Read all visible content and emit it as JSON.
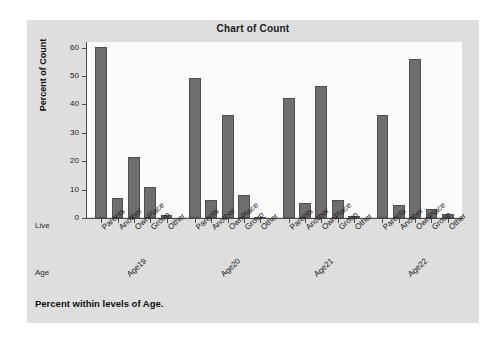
{
  "chart_data": {
    "type": "bar",
    "title": "Chart of Count",
    "xlabel": "",
    "ylabel": "Percent of Count",
    "ylim": [
      0,
      62
    ],
    "yticks": [
      0,
      10,
      20,
      30,
      40,
      50,
      60
    ],
    "grid": false,
    "legend": null,
    "footnote": "Percent within levels of Age.",
    "row_labels": {
      "categories": "Live",
      "groups": "Age"
    },
    "categories": [
      "Parents",
      "Another",
      "OwnPlace",
      "Group",
      "Other"
    ],
    "groups": [
      "Age19",
      "Age20",
      "Age21",
      "Age22"
    ],
    "series": [
      {
        "name": "Age19",
        "values": [
          60.2,
          7.0,
          21.6,
          11.0,
          1.2
        ]
      },
      {
        "name": "Age20",
        "values": [
          49.4,
          6.4,
          36.4,
          8.1,
          0.5
        ]
      },
      {
        "name": "Age21",
        "values": [
          42.2,
          5.3,
          46.5,
          6.5,
          0.7
        ]
      },
      {
        "name": "Age22",
        "values": [
          36.4,
          4.7,
          56.0,
          3.3,
          1.5
        ]
      }
    ],
    "colors": {
      "bar_fill": "#6e6e6e",
      "bar_edge": "#4f4f4f",
      "panel_background": "#dedede",
      "plot_background": "#fbfbfb",
      "axis": "#4a4a4a",
      "text": "#1a1a1a"
    }
  }
}
